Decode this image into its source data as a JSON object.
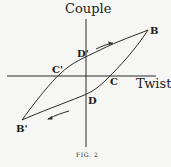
{
  "figure": {
    "y_axis_label": "Couple",
    "x_axis_label": "Twist",
    "caption": "FIG. 2",
    "points": {
      "B": "B",
      "B_prime": "B'",
      "C": "C",
      "C_prime": "C'",
      "D": "D",
      "D_prime": "D'"
    },
    "arrows": {
      "upper": "arrow-right",
      "lower": "arrow-left"
    },
    "colors": {
      "ink": "#2a2a2a",
      "paper": "#f6f6f4"
    }
  }
}
